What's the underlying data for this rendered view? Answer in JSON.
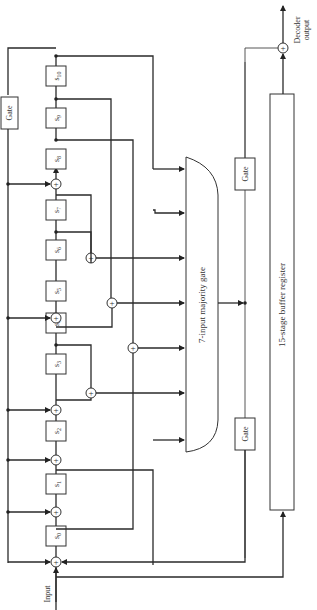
{
  "diagram": {
    "title": "",
    "input_label": "Input",
    "output_label_line1": "Decoder",
    "output_label_line2": "output",
    "gate_top_label": "Gate",
    "gate_mid_top_label": "Gate",
    "gate_mid_bottom_label": "Gate",
    "majority_gate_label": "7-input majority gate",
    "buffer_label": "15-stage buffer register",
    "stages": [
      {
        "id": "s0",
        "label": "s",
        "sub": "0"
      },
      {
        "id": "s1",
        "label": "s",
        "sub": "1"
      },
      {
        "id": "s2",
        "label": "s",
        "sub": "2"
      },
      {
        "id": "s3",
        "label": "s",
        "sub": "3"
      },
      {
        "id": "s4",
        "label": "s",
        "sub": "4"
      },
      {
        "id": "s5",
        "label": "s",
        "sub": "5"
      },
      {
        "id": "s6",
        "label": "s",
        "sub": "6"
      },
      {
        "id": "s7",
        "label": "s",
        "sub": "7"
      },
      {
        "id": "s8",
        "label": "s",
        "sub": "8"
      },
      {
        "id": "s9",
        "label": "s",
        "sub": "9"
      },
      {
        "id": "s10",
        "label": "s",
        "sub": "10"
      }
    ],
    "xor_symbol": "+"
  }
}
